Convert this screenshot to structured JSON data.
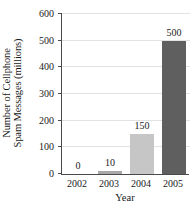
{
  "chart_data": {
    "type": "bar",
    "title": "",
    "xlabel": "Year",
    "ylabel_line1": "Number of Cellphone",
    "ylabel_line2": "Spam Messages (millions)",
    "categories": [
      "2002",
      "2003",
      "2004",
      "2005"
    ],
    "values": [
      0,
      10,
      150,
      500
    ],
    "value_labels": [
      "0",
      "10",
      "150",
      "500"
    ],
    "bar_colors": [
      "#bdbdbd",
      "#a8a8a8",
      "#c6c6c6",
      "#5f5f5f"
    ],
    "ylim": [
      0,
      600
    ],
    "yticks": [
      0,
      100,
      200,
      300,
      400,
      500,
      600
    ],
    "ytick_labels": [
      "0",
      "100",
      "200",
      "300",
      "400",
      "500",
      "600"
    ],
    "grid": true,
    "grid_color": "#e2e2e2",
    "legend": "none",
    "axis_color": "#4a4a4a",
    "background": "#ffffff"
  },
  "figure": {
    "title_remnant": ""
  }
}
